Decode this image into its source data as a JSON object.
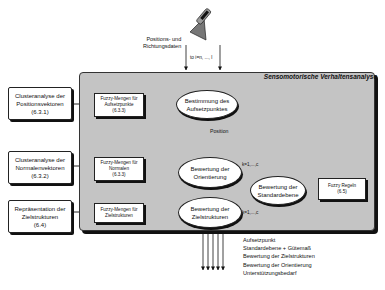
{
  "input": {
    "label_line1": "Positions- und",
    "label_line2": "Richtungsdaten",
    "index_label": "to i=n, ..., l",
    "sensor_icon": "sensor-probe-icon"
  },
  "panel": {
    "title": "Sensomotorische Verhaltensanalyse"
  },
  "left_boxes": [
    {
      "line1": "Clusteranalyse der",
      "line2": "Positionsvektoren",
      "ref": "(6.3.1)"
    },
    {
      "line1": "Clusteranalyse der",
      "line2": "Normalenvektoren",
      "ref": "(6.3.2)"
    },
    {
      "line1": "Repräsentation der",
      "line2": "Zielstrukturen",
      "ref": "(6.4)"
    }
  ],
  "fuzzy_boxes": [
    {
      "line1": "Fuzzy-Mengen für",
      "line2": "Aufsetzpunkte",
      "ref": "(6.3.3)"
    },
    {
      "line1": "Fuzzy-Mengen für",
      "line2": "Normalen",
      "ref": "(6.3.3)"
    },
    {
      "line1": "Fuzzy-Mengen für",
      "line2": "Zielstrukturen",
      "ref": ""
    }
  ],
  "ellipses": {
    "aufsetz": {
      "line1": "Bestimmung des",
      "line2": "Aufsetzpunktes"
    },
    "orient": {
      "line1": "Bewertung der",
      "line2": "Orientierung"
    },
    "ziel": {
      "line1": "Bewertung der",
      "line2": "Zielstrukturen"
    },
    "standard": {
      "line1": "Bewertung der",
      "line2": "Standardebene"
    }
  },
  "rules_box": {
    "line1": "Fuzzy Regeln",
    "ref": "(6.5)"
  },
  "edge_labels": {
    "position": "Position",
    "k_orient": "k=1,...,c",
    "k_ziel": "k=1,...,c"
  },
  "outputs": [
    "Aufsetzpunkt",
    "Standardebene + Gütemaß",
    "Bewertung der Zielstrukturen",
    "Bewertung der Orientierung",
    "Unterstützungsbedarf"
  ]
}
